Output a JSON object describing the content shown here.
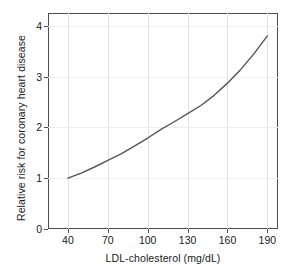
{
  "chart_data": {
    "type": "line",
    "title": "",
    "xlabel": "LDL-cholesterol (mg/dL)",
    "ylabel": "Relative risk for coronary heart disease",
    "xlim": [
      25,
      198
    ],
    "ylim": [
      0,
      4.25
    ],
    "xticks": [
      40,
      70,
      100,
      130,
      160,
      190
    ],
    "xtick_labels": [
      "40",
      "70",
      "100",
      "130",
      "160",
      "190"
    ],
    "yticks": [
      0,
      1,
      2,
      3,
      4
    ],
    "ytick_labels": [
      "0",
      "1",
      "2",
      "3",
      "4"
    ],
    "grid": "vertical",
    "legend": "none",
    "series": [
      {
        "name": "Relative risk",
        "color": "#555555",
        "line_width": 1.4,
        "x": [
          40,
          50,
          60,
          70,
          80,
          90,
          100,
          110,
          120,
          130,
          140,
          150,
          160,
          170,
          180,
          190
        ],
        "y": [
          1.0,
          1.1,
          1.22,
          1.35,
          1.48,
          1.63,
          1.79,
          1.96,
          2.11,
          2.27,
          2.43,
          2.63,
          2.87,
          3.14,
          3.45,
          3.8
        ]
      }
    ],
    "axis_color": "#4d4d4d",
    "gridline_color": "#e2e2e2",
    "background_color": "#ffffff"
  },
  "axes": {
    "x_title": "LDL-cholesterol (mg/dL)",
    "y_title": "Relative risk for coronary heart disease"
  }
}
